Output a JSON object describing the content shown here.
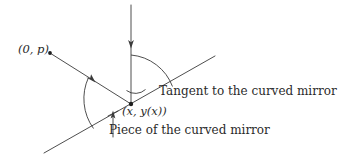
{
  "figure": {
    "background_color": "#ffffff",
    "stroke_color": "#3a3a3a",
    "node_color": "#1e1e1e"
  },
  "labels": {
    "source_point": "(0, p)",
    "contact_point": "(x, y(x))",
    "tangent_line": "Tangent to the curved mirror",
    "mirror_piece": "Piece of the curved mirror"
  },
  "geometry": {
    "contact_point_px": [
      131,
      104
    ],
    "source_point_px": [
      50,
      53
    ],
    "vertical_ray": {
      "from": [
        131,
        5
      ],
      "to": [
        131,
        104
      ],
      "arrow_at": [
        131,
        46
      ]
    },
    "incident_ray": {
      "from": [
        50,
        53
      ],
      "to": [
        131,
        104
      ],
      "arrow_at": [
        93,
        80
      ]
    },
    "tangent_line": {
      "from": [
        44,
        153
      ],
      "to": [
        215,
        56
      ]
    },
    "big_arc_radius": 51,
    "small_arc_radius": 49,
    "pointer_line": {
      "from": [
        113,
        137
      ],
      "to": [
        113,
        112
      ]
    }
  },
  "icons": {
    "arrowhead": "arrow-head-icon",
    "node": "point-dot-icon"
  }
}
